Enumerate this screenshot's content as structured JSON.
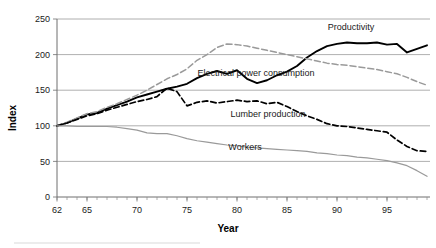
{
  "chart_data": {
    "type": "line",
    "title": "",
    "xlabel": "Year",
    "ylabel": "Index",
    "xlim": [
      62,
      99
    ],
    "ylim": [
      0,
      250
    ],
    "yticks": [
      0,
      50,
      100,
      150,
      200,
      250
    ],
    "xticks": [
      62,
      65,
      70,
      75,
      80,
      85,
      90,
      95
    ],
    "xtick_labels": [
      "62",
      "65",
      "70",
      "75",
      "80",
      "85",
      "90",
      "95"
    ],
    "ytick_labels": [
      "0",
      "50",
      "100",
      "150",
      "200",
      "250"
    ],
    "grid": "horizontal",
    "legend_position": "inline-annotations",
    "x": [
      62,
      63,
      64,
      65,
      66,
      67,
      68,
      69,
      70,
      71,
      72,
      73,
      74,
      75,
      76,
      77,
      78,
      79,
      80,
      81,
      82,
      83,
      84,
      85,
      86,
      87,
      88,
      89,
      90,
      91,
      92,
      93,
      94,
      95,
      96,
      97,
      98,
      99
    ],
    "series": [
      {
        "name": "Productivity",
        "style": "solid-black-thick",
        "color": "#000000",
        "label_x": 351,
        "label_y": 30,
        "values": [
          100,
          104,
          110,
          116,
          118,
          124,
          129,
          134,
          140,
          144,
          148,
          152,
          155,
          159,
          167,
          173,
          177,
          173,
          178,
          166,
          160,
          164,
          171,
          176,
          184,
          196,
          205,
          212,
          215,
          217,
          216,
          216,
          217,
          214,
          215,
          203,
          208,
          213
        ]
      },
      {
        "name": "Electrical power consumption",
        "style": "dashed-gray",
        "color": "#9a9a9a",
        "label_x": 256,
        "label_y": 76,
        "values": [
          100,
          105,
          111,
          117,
          120,
          126,
          131,
          137,
          143,
          150,
          158,
          166,
          172,
          180,
          192,
          200,
          210,
          215,
          214,
          212,
          209,
          206,
          203,
          200,
          197,
          194,
          191,
          188,
          186,
          185,
          183,
          181,
          179,
          176,
          173,
          168,
          162,
          157
        ]
      },
      {
        "name": "Lumber production",
        "style": "dashed-black",
        "color": "#000000",
        "label_x": 268,
        "label_y": 117,
        "values": [
          100,
          104,
          109,
          114,
          117,
          122,
          126,
          130,
          134,
          137,
          141,
          153,
          148,
          128,
          133,
          135,
          132,
          134,
          136,
          134,
          135,
          131,
          133,
          127,
          120,
          114,
          109,
          103,
          100,
          99,
          97,
          95,
          93,
          91,
          80,
          71,
          65,
          64
        ]
      },
      {
        "name": "Workers",
        "style": "solid-gray",
        "color": "#9a9a9a",
        "label_x": 245,
        "label_y": 150,
        "values": [
          100,
          100,
          99,
          99,
          99,
          99,
          98,
          96,
          94,
          90,
          89,
          89,
          86,
          82,
          79,
          77,
          75,
          73,
          72,
          70,
          69,
          68,
          67,
          66,
          65,
          64,
          62,
          61,
          59,
          58,
          56,
          55,
          53,
          51,
          48,
          44,
          37,
          29
        ]
      }
    ]
  },
  "axes": {
    "y_title": "Index",
    "x_title": "Year"
  }
}
